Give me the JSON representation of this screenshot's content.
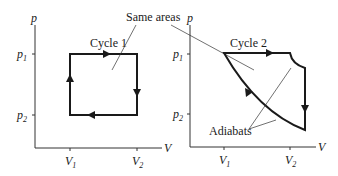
{
  "figure": {
    "annotation_same_areas": "Same areas",
    "annotation_adiabats": "Adiabats",
    "left_plot": {
      "title": "Cycle 1",
      "y_axis_label": "p",
      "x_axis_label": "V",
      "y_ticks": [
        {
          "main": "p",
          "sub": "1"
        },
        {
          "main": "p",
          "sub": "2"
        }
      ],
      "x_ticks": [
        {
          "main": "V",
          "sub": "1"
        },
        {
          "main": "V",
          "sub": "2"
        }
      ],
      "shape": "rectangle",
      "direction": "clockwise"
    },
    "right_plot": {
      "title": "Cycle 2",
      "y_axis_label": "p",
      "x_axis_label": "V",
      "y_ticks": [
        {
          "main": "p",
          "sub": "1"
        },
        {
          "main": "p",
          "sub": "2"
        }
      ],
      "x_ticks": [
        {
          "main": "V",
          "sub": "1"
        },
        {
          "main": "V",
          "sub": "2"
        }
      ],
      "shape": "isobar-adiabat-isochore-adiabat",
      "direction": "clockwise"
    }
  }
}
